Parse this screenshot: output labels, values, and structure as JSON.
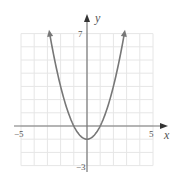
{
  "chart_data": {
    "type": "line",
    "title": "",
    "xlabel": "x",
    "ylabel": "y",
    "xlim": [
      -5,
      5
    ],
    "ylim": [
      -3,
      7
    ],
    "grid": true,
    "tick_labels": {
      "x_min": "−5",
      "x_max": "5",
      "y_max": "7",
      "y_min": "−3"
    },
    "series": [
      {
        "name": "y = x² − 1",
        "equation": "y = x^2 - 1",
        "x": [
          -2.83,
          -2.5,
          -2,
          -1.5,
          -1,
          -0.5,
          0,
          0.5,
          1,
          1.5,
          2,
          2.5,
          2.83
        ],
        "y": [
          7,
          5.25,
          3,
          1.25,
          0,
          -0.75,
          -1,
          -0.75,
          0,
          1.25,
          3,
          5.25,
          7
        ],
        "arrows_at_ends": true,
        "color": "#777777"
      }
    ]
  },
  "labels": {
    "x_axis": "x",
    "y_axis": "y",
    "x_min": "−5",
    "x_max": "5",
    "y_max": "7",
    "y_min": "−3"
  },
  "colors": {
    "grid": "#e6e6e6",
    "axis": "#777777",
    "curve": "#777777"
  }
}
